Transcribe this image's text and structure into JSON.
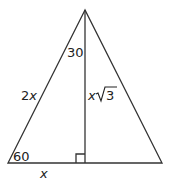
{
  "diagram": {
    "type": "30-60-90 triangle with altitude",
    "stroke_color": "#333333",
    "labels": {
      "angle_top": "30",
      "angle_bottom_left": "60",
      "hypotenuse": "2x",
      "hypotenuse_coef": "2",
      "hypotenuse_var": "x",
      "altitude_var": "x",
      "altitude_root": "3",
      "base": "x"
    }
  }
}
